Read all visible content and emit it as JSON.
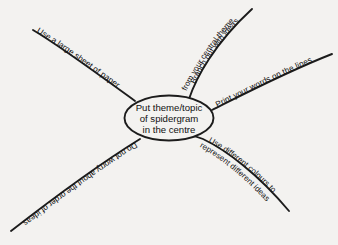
{
  "diagram": {
    "type": "spidergram",
    "background_color": "#f3f2f0",
    "line_color": "#1c1c1c",
    "text_color": "#111111",
    "center_node": {
      "shape": "ellipse",
      "lines": [
        "Put theme/topic",
        "of spidergram",
        "in the centre"
      ]
    },
    "branches": [
      {
        "id": "top-left",
        "direction": "upper-left",
        "lines": [
          "Use a large sheet of paper"
        ]
      },
      {
        "id": "top-center",
        "direction": "upper-right-steep",
        "lines": [
          "Branch out with ideas",
          "from your central theme"
        ]
      },
      {
        "id": "right",
        "direction": "right-up",
        "lines": [
          "Print your words on the lines"
        ]
      },
      {
        "id": "bottom-right",
        "direction": "lower-right",
        "lines": [
          "Use different colours to",
          "represent different ideas"
        ]
      },
      {
        "id": "bottom-left",
        "direction": "lower-left",
        "lines": [
          "Do not worry about the order of ideas"
        ]
      }
    ]
  }
}
